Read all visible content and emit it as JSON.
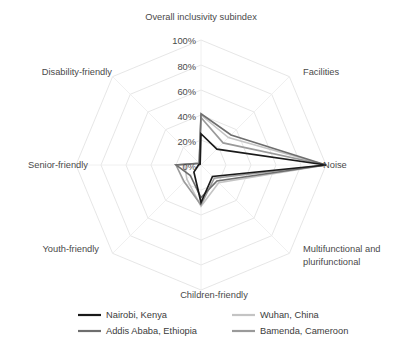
{
  "chart_data": {
    "type": "radar",
    "title": "",
    "categories": [
      "Overall inclusivity subindex",
      "Facilities",
      "Noise",
      "Multifunctional and plurifunctional",
      "Children-friendly",
      "Youth-friendly",
      "Senior-friendly",
      "Disability-friendly"
    ],
    "tick_labels": [
      "0%",
      "20%",
      "40%",
      "60%",
      "80%",
      "100%"
    ],
    "tick_values": [
      0,
      20,
      40,
      60,
      80,
      100
    ],
    "rlim": [
      0,
      100
    ],
    "grid": true,
    "legend_position": "bottom",
    "series": [
      {
        "name": "Nairobi, Kenya",
        "color": "#1a1a1a",
        "values": [
          25,
          18,
          100,
          13,
          30,
          8,
          2,
          1
        ]
      },
      {
        "name": "Wuhan, China",
        "color": "#c4c4c4",
        "values": [
          40,
          31,
          100,
          20,
          33,
          16,
          13,
          2
        ]
      },
      {
        "name": "Addis Ababa, Ethiopia",
        "color": "#6e6e6e",
        "values": [
          41,
          34,
          100,
          18,
          26,
          12,
          20,
          2
        ]
      },
      {
        "name": "Bamenda, Cameroon",
        "color": "#9a9a9a",
        "values": [
          38,
          25,
          100,
          15,
          32,
          19,
          20,
          2
        ]
      }
    ]
  },
  "axis_labels": {
    "top": "Overall inclusivity subindex",
    "top_right": "Facilities",
    "right": "Noise",
    "bottom_right_line1": "Multifunctional and",
    "bottom_right_line2": "plurifunctional",
    "bottom": "Children-friendly",
    "bottom_left": "Youth-friendly",
    "left": "Senior-friendly",
    "top_left": "Disability-friendly"
  },
  "ticks": {
    "t0": "0%",
    "t20": "20%",
    "t40": "40%",
    "t60": "60%",
    "t80": "80%",
    "t100": "100%"
  },
  "legend": {
    "items": [
      {
        "label": "Nairobi, Kenya",
        "color": "#1a1a1a"
      },
      {
        "label": "Wuhan, China",
        "color": "#c4c4c4"
      },
      {
        "label": "Addis Ababa, Ethiopia",
        "color": "#6e6e6e"
      },
      {
        "label": "Bamenda, Cameroon",
        "color": "#9a9a9a"
      }
    ]
  }
}
